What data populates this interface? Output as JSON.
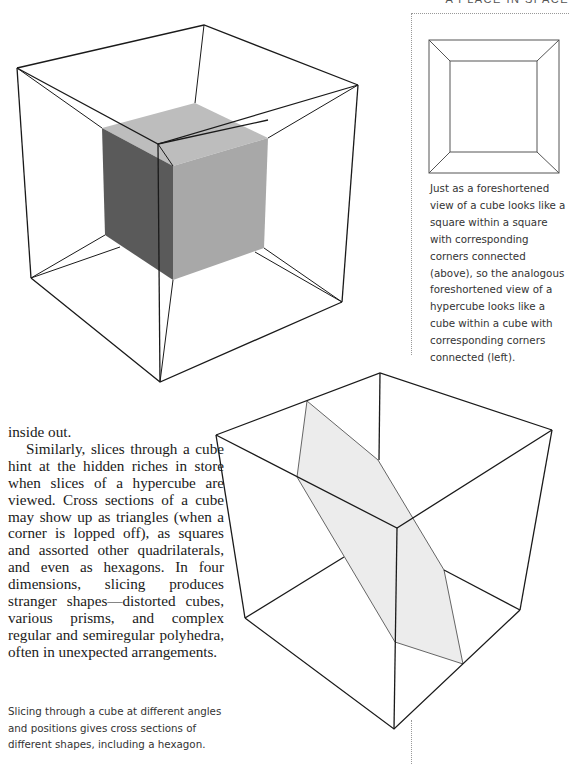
{
  "page": {
    "running_head": "A PLACE IN SPACE"
  },
  "sidebar": {
    "figure": "square-within-square",
    "caption": "Just as a foreshortened view of a cube looks like a square within a square with corresponding corners connected (above), so the analogous foreshortened view of a hypercube looks like a cube within a cube with corresponding corners connected (left)."
  },
  "hypercube_figure": {
    "name": "hypercube-cube-within-cube",
    "colors": {
      "line": "#1a1a1a",
      "inner_top": "#bdbdbd",
      "inner_left": "#5a5a5a",
      "inner_right": "#a8a8a8"
    }
  },
  "body": {
    "paragraph_1_end": "inside out.",
    "paragraph_2": "Similarly, slices through a cube hint at the hidden riches in store when slices of a hypercube are viewed. Cross sections of a cube may show up as triangles (when a corner is lopped off), as squares and assorted other quadrilaterals, and even as hexagons. In four dimensions, slicing produces stranger shapes—distorted cubes, various prisms, and complex regular and semiregular polyhedra, often in unexpected arrangements."
  },
  "sliced_cube_figure": {
    "name": "cube-with-hexagonal-cross-section",
    "colors": {
      "line": "#1a1a1a",
      "hexagon_fill": "#ececec",
      "hexagon_stroke": "#555555"
    },
    "caption": "Slicing through a cube at different angles and positions gives cross sections of different shapes, including a hexagon."
  }
}
